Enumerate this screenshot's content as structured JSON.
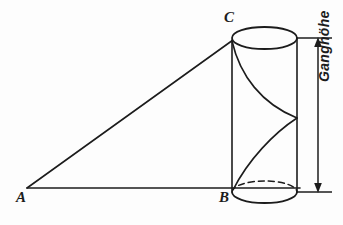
{
  "figure": {
    "background_color": "#fdfdfd",
    "stroke_color": "#1c1c1c",
    "labels": {
      "vertex_a": "A",
      "vertex_b": "B",
      "vertex_c": "C",
      "dimension": "Ganghöhe"
    },
    "geometry": {
      "triangle": {
        "a": [
          27,
          188
        ],
        "b": [
          232,
          188
        ],
        "c": [
          232,
          40
        ]
      },
      "cylinder": {
        "center_x": 264.5,
        "radius_x": 32.5,
        "radius_y": 11,
        "top_y": 38,
        "bottom_y": 192
      },
      "dimension_line": {
        "x": 318,
        "top_y": 38,
        "bottom_y": 192,
        "tick_left_x": 297
      },
      "helix": {
        "start": [
          232,
          41
        ],
        "mid": [
          297,
          118
        ],
        "end": [
          232,
          190
        ]
      }
    }
  }
}
